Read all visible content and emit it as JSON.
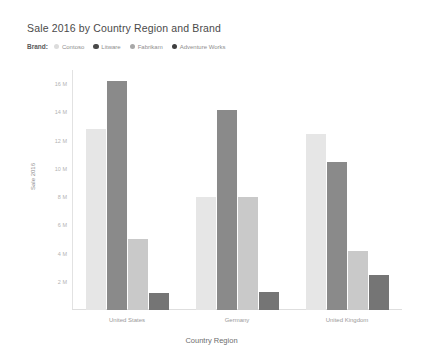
{
  "chart_data": {
    "type": "bar",
    "title": "Sale 2016 by Country Region and Brand",
    "xlabel": "Country Region",
    "ylabel": "Sale 2016",
    "grid": false,
    "legend_position": "top-left",
    "legend_title": "Brand:",
    "categories": [
      "United States",
      "Germany",
      "United Kingdom"
    ],
    "yticks": [
      "16 M",
      "14 M",
      "12 M",
      "10 M",
      "8 M",
      "6 M",
      "4 M",
      "2 M"
    ],
    "ytick_values": [
      16000000,
      14000000,
      12000000,
      10000000,
      8000000,
      6000000,
      4000000,
      2000000
    ],
    "ylim": [
      0,
      17000000
    ],
    "series": [
      {
        "name": "Contoso",
        "color": "#e6e6e6",
        "values": [
          12800000,
          8000000,
          12500000
        ]
      },
      {
        "name": "Litware",
        "color": "#8a8a8a",
        "values": [
          16200000,
          14200000,
          10500000
        ]
      },
      {
        "name": "Fabrikam",
        "color": "#c9c9c9",
        "values": [
          5000000,
          8000000,
          4200000
        ]
      },
      {
        "name": "Adventure Works",
        "color": "#757575",
        "values": [
          1200000,
          1300000,
          2500000
        ]
      }
    ]
  },
  "legend": {
    "title": "Brand:",
    "items": [
      {
        "label": "Contoso",
        "color": "#dcdcdc"
      },
      {
        "label": "Litware",
        "color": "#4a4a4a"
      },
      {
        "label": "Fabrikam",
        "color": "#a8a8a8"
      },
      {
        "label": "Adventure Works",
        "color": "#3f3f3f"
      }
    ]
  }
}
